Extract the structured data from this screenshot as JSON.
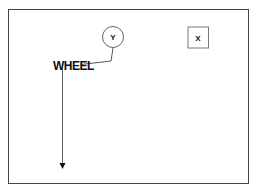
{
  "diagram": {
    "nodes": [
      {
        "id": "y",
        "shape": "circle",
        "label": "Y"
      },
      {
        "id": "x",
        "shape": "square",
        "label": "X"
      }
    ],
    "labels": {
      "wheel": "WHEEL"
    },
    "edges": [
      {
        "from": "y",
        "to": "wheel",
        "style": "polyline"
      },
      {
        "from": "wheel",
        "to": "bottom",
        "style": "arrow"
      }
    ],
    "colors": {
      "stroke": "#444444",
      "text": "#111111",
      "background": "#ffffff"
    }
  }
}
